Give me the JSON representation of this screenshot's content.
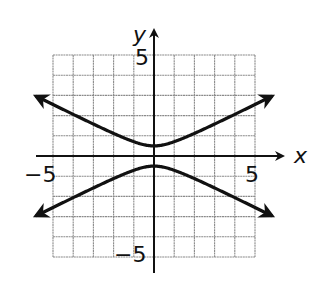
{
  "chart_data": {
    "type": "line",
    "title": "",
    "xlabel": "x",
    "ylabel": "y",
    "xlim": [
      -5,
      5
    ],
    "ylim": [
      -5,
      5
    ],
    "grid": true,
    "grid_step": 1,
    "tick_labels": {
      "x": [
        {
          "value": -5,
          "label": "−5"
        },
        {
          "value": 5,
          "label": "5"
        }
      ],
      "y": [
        {
          "value": 5,
          "label": "5"
        },
        {
          "value": -5,
          "label": "−5"
        }
      ]
    },
    "series": [
      {
        "name": "upper branch",
        "x": [
          -5.85,
          -5,
          -4,
          -3,
          -2,
          -1,
          0,
          1,
          2,
          3,
          4,
          5,
          5.85
        ],
        "y": [
          2.97,
          2.55,
          2.06,
          1.58,
          1.12,
          0.71,
          0.5,
          0.71,
          1.12,
          1.58,
          2.06,
          2.55,
          2.97
        ],
        "arrows": "both ends"
      },
      {
        "name": "lower branch",
        "x": [
          -5.85,
          -5,
          -4,
          -3,
          -2,
          -1,
          0,
          1,
          2,
          3,
          4,
          5,
          5.85
        ],
        "y": [
          -2.97,
          -2.55,
          -2.06,
          -1.58,
          -1.12,
          -0.71,
          -0.5,
          -0.71,
          -1.12,
          -1.58,
          -2.06,
          -2.55,
          -2.97
        ],
        "arrows": "both ends"
      }
    ]
  },
  "labels": {
    "x_axis": "x",
    "y_axis": "y",
    "x_min": "−5",
    "x_max": "5",
    "y_max": "5",
    "y_min": "−5"
  },
  "colors": {
    "grid": "#8a8a8a",
    "axis": "#111111",
    "curve": "#111111"
  }
}
